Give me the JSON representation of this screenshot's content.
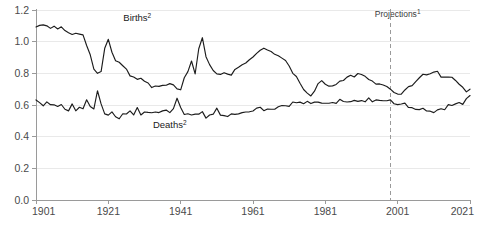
{
  "chart_data": {
    "type": "line",
    "title": "",
    "subtitle": "",
    "xlabel": "",
    "ylabel": "",
    "xlim": [
      1901,
      2021
    ],
    "ylim": [
      0.0,
      1.2
    ],
    "grid": true,
    "legend_position": "inline-annotation",
    "x_ticks": [
      "1901",
      "1921",
      "1941",
      "1961",
      "1981",
      "2001",
      "2021"
    ],
    "x_tick_values": [
      1901,
      1921,
      1941,
      1961,
      1981,
      2001,
      2021
    ],
    "y_ticks": [
      "0.0",
      "0.2",
      "0.4",
      "0.6",
      "0.8",
      "1.0",
      "1.2"
    ],
    "y_tick_values": [
      0.0,
      0.2,
      0.4,
      0.6,
      0.8,
      1.0,
      1.2
    ],
    "annotations": [
      {
        "name": "births-label",
        "text": "Births",
        "superscript": "2",
        "x": 1929,
        "y": 1.13
      },
      {
        "name": "deaths-label",
        "text": "Deaths",
        "superscript": "2",
        "x": 1938,
        "y": 0.455
      },
      {
        "name": "projections-label",
        "text": "Projections",
        "superscript": "1",
        "x": 2001,
        "y": 1.155
      }
    ],
    "projection_divider": {
      "x": 1999,
      "style": "dashed"
    },
    "x": [
      1901,
      1902,
      1903,
      1904,
      1905,
      1906,
      1907,
      1908,
      1909,
      1910,
      1911,
      1912,
      1913,
      1914,
      1915,
      1916,
      1917,
      1918,
      1919,
      1920,
      1921,
      1922,
      1923,
      1924,
      1925,
      1926,
      1927,
      1928,
      1929,
      1930,
      1931,
      1932,
      1933,
      1934,
      1935,
      1936,
      1937,
      1938,
      1939,
      1940,
      1941,
      1942,
      1943,
      1944,
      1945,
      1946,
      1947,
      1948,
      1949,
      1950,
      1951,
      1952,
      1953,
      1954,
      1955,
      1956,
      1957,
      1958,
      1959,
      1960,
      1961,
      1962,
      1963,
      1964,
      1965,
      1966,
      1967,
      1968,
      1969,
      1970,
      1971,
      1972,
      1973,
      1974,
      1975,
      1976,
      1977,
      1978,
      1979,
      1980,
      1981,
      1982,
      1983,
      1984,
      1985,
      1986,
      1987,
      1988,
      1989,
      1990,
      1991,
      1992,
      1993,
      1994,
      1995,
      1996,
      1997,
      1998,
      1999,
      2000,
      2001,
      2002,
      2003,
      2004,
      2005,
      2006,
      2007,
      2008,
      2009,
      2010,
      2011,
      2012,
      2013,
      2014,
      2015,
      2016,
      2017,
      2018,
      2019,
      2020,
      2021
    ],
    "series": [
      {
        "name": "Births",
        "label": "Births",
        "superscript": "2",
        "color": "#1c1c1c",
        "values": [
          1.093,
          1.103,
          1.106,
          1.1,
          1.084,
          1.098,
          1.08,
          1.094,
          1.07,
          1.056,
          1.045,
          1.053,
          1.048,
          1.043,
          0.976,
          0.917,
          0.826,
          0.8,
          0.811,
          0.958,
          1.015,
          0.933,
          0.88,
          0.87,
          0.848,
          0.827,
          0.784,
          0.777,
          0.762,
          0.769,
          0.75,
          0.739,
          0.71,
          0.72,
          0.718,
          0.724,
          0.725,
          0.735,
          0.727,
          0.702,
          0.696,
          0.772,
          0.811,
          0.878,
          0.796,
          0.955,
          1.025,
          0.905,
          0.855,
          0.818,
          0.797,
          0.793,
          0.804,
          0.795,
          0.789,
          0.825,
          0.838,
          0.854,
          0.865,
          0.886,
          0.903,
          0.926,
          0.946,
          0.959,
          0.947,
          0.938,
          0.92,
          0.911,
          0.896,
          0.881,
          0.846,
          0.8,
          0.78,
          0.737,
          0.698,
          0.675,
          0.657,
          0.687,
          0.735,
          0.754,
          0.731,
          0.719,
          0.721,
          0.73,
          0.751,
          0.755,
          0.776,
          0.788,
          0.777,
          0.799,
          0.793,
          0.781,
          0.761,
          0.751,
          0.732,
          0.733,
          0.726,
          0.717,
          0.7,
          0.679,
          0.669,
          0.668,
          0.695,
          0.716,
          0.722,
          0.748,
          0.772,
          0.794,
          0.79,
          0.797,
          0.808,
          0.813,
          0.776,
          0.776,
          0.777,
          0.775,
          0.755,
          0.731,
          0.712,
          0.683,
          0.7
        ]
      },
      {
        "name": "Deaths",
        "label": "Deaths",
        "superscript": "2",
        "color": "#1c1c1c",
        "values": [
          0.632,
          0.615,
          0.595,
          0.62,
          0.602,
          0.601,
          0.591,
          0.603,
          0.573,
          0.563,
          0.607,
          0.563,
          0.586,
          0.576,
          0.633,
          0.591,
          0.575,
          0.69,
          0.607,
          0.544,
          0.536,
          0.557,
          0.526,
          0.513,
          0.545,
          0.543,
          0.563,
          0.537,
          0.584,
          0.537,
          0.556,
          0.553,
          0.551,
          0.556,
          0.552,
          0.563,
          0.568,
          0.552,
          0.577,
          0.643,
          0.584,
          0.54,
          0.545,
          0.537,
          0.542,
          0.542,
          0.558,
          0.517,
          0.537,
          0.542,
          0.58,
          0.536,
          0.533,
          0.527,
          0.544,
          0.541,
          0.544,
          0.552,
          0.556,
          0.557,
          0.562,
          0.58,
          0.586,
          0.564,
          0.575,
          0.573,
          0.573,
          0.589,
          0.597,
          0.595,
          0.591,
          0.619,
          0.614,
          0.618,
          0.608,
          0.623,
          0.609,
          0.618,
          0.618,
          0.612,
          0.611,
          0.611,
          0.616,
          0.61,
          0.636,
          0.622,
          0.619,
          0.621,
          0.629,
          0.623,
          0.628,
          0.62,
          0.645,
          0.62,
          0.632,
          0.629,
          0.627,
          0.627,
          0.632,
          0.608,
          0.602,
          0.606,
          0.612,
          0.584,
          0.583,
          0.572,
          0.571,
          0.579,
          0.562,
          0.561,
          0.552,
          0.569,
          0.576,
          0.57,
          0.602,
          0.597,
          0.607,
          0.616,
          0.604,
          0.64,
          0.66
        ]
      }
    ],
    "notes": {
      "projections_note": "1",
      "series_note": "2"
    }
  },
  "colors": {
    "line": "#1c1c1c",
    "grid": "#e9e9e9",
    "axis": "#9a9a9a",
    "tick_text": "#4a4a4a",
    "label_text": "#1a1a1a",
    "background": "#ffffff"
  }
}
